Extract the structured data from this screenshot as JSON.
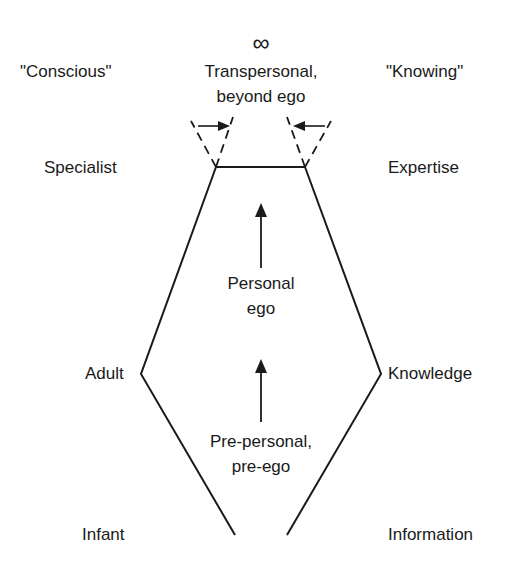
{
  "diagram": {
    "title": "",
    "left_column_header": "\"Conscious\"",
    "right_column_header": "\"Knowing\"",
    "top_symbol": "∞",
    "top_label_line1": "Transpersonal,",
    "top_label_line2": "beyond ego",
    "levels": [
      {
        "left": "Specialist",
        "right": "Expertise"
      },
      {
        "left": "Adult",
        "right": "Knowledge"
      },
      {
        "left": "Infant",
        "right": "Information"
      }
    ],
    "middle_label": {
      "line1": "Personal",
      "line2": "ego"
    },
    "lower_label": {
      "line1": "Pre-personal,",
      "line2": "pre-ego"
    },
    "colors": {
      "ink": "#1a1a1a",
      "background": "#ffffff"
    },
    "shape": {
      "outline_points": [
        [
          235,
          535
        ],
        [
          141,
          374
        ],
        [
          216,
          167
        ],
        [
          305,
          167
        ],
        [
          381,
          374
        ],
        [
          287,
          535
        ]
      ],
      "top_edge": [
        [
          216,
          167
        ],
        [
          305,
          167
        ]
      ],
      "left_funnel": {
        "apex": [
          216,
          167
        ],
        "top_left": [
          191,
          121
        ],
        "top_right": [
          233,
          117
        ],
        "arrow_from": [
          198,
          126
        ],
        "arrow_to": [
          229,
          126
        ]
      },
      "right_funnel": {
        "apex": [
          305,
          167
        ],
        "top_left": [
          287,
          117
        ],
        "top_right": [
          331,
          121
        ],
        "arrow_from": [
          325,
          126
        ],
        "arrow_to": [
          293,
          126
        ]
      },
      "upper_arrow": {
        "x": 261,
        "from_y": 268,
        "to_y": 204
      },
      "lower_arrow": {
        "x": 261,
        "from_y": 422,
        "to_y": 359
      }
    }
  }
}
